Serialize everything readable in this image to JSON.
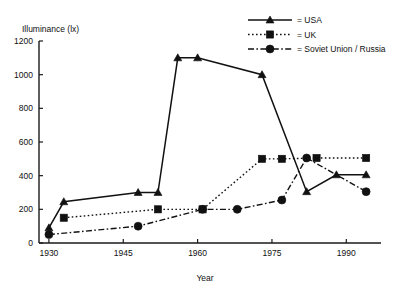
{
  "chart_data": {
    "type": "line",
    "title": "",
    "xlabel": "Year",
    "ylabel": "Illuminance (lx)",
    "xlim": [
      1928,
      1997
    ],
    "ylim": [
      0,
      1200
    ],
    "xticks": [
      1930,
      1945,
      1960,
      1975,
      1990
    ],
    "xticklabels": [
      "1930",
      "1945",
      "1960",
      "1975",
      "1990"
    ],
    "yticks": [
      0,
      200,
      400,
      600,
      800,
      1000,
      1200
    ],
    "yticklabels": [
      "0",
      "200",
      "400",
      "600",
      "800",
      "1000",
      "1200"
    ],
    "grid": false,
    "legend_position": "top-right",
    "series": [
      {
        "name": "USA",
        "legend_label": "= USA",
        "marker": "triangle",
        "linestyle": "solid",
        "color": "#111111",
        "points": [
          {
            "x": 1930,
            "y": 90
          },
          {
            "x": 1933,
            "y": 245
          },
          {
            "x": 1948,
            "y": 300
          },
          {
            "x": 1952,
            "y": 300
          },
          {
            "x": 1956,
            "y": 1100
          },
          {
            "x": 1960,
            "y": 1100
          },
          {
            "x": 1973,
            "y": 1000
          },
          {
            "x": 1982,
            "y": 305
          },
          {
            "x": 1988,
            "y": 405
          },
          {
            "x": 1994,
            "y": 405
          }
        ]
      },
      {
        "name": "UK",
        "legend_label": "= UK",
        "marker": "square",
        "linestyle": "dotted",
        "color": "#111111",
        "points": [
          {
            "x": 1933,
            "y": 150
          },
          {
            "x": 1952,
            "y": 200
          },
          {
            "x": 1961,
            "y": 200
          },
          {
            "x": 1973,
            "y": 500
          },
          {
            "x": 1977,
            "y": 500
          },
          {
            "x": 1984,
            "y": 505
          },
          {
            "x": 1994,
            "y": 505
          }
        ]
      },
      {
        "name": "Soviet Union / Russia",
        "legend_label": "= Soviet Union / Russia",
        "marker": "circle",
        "linestyle": "dashdot",
        "color": "#111111",
        "points": [
          {
            "x": 1930,
            "y": 50
          },
          {
            "x": 1948,
            "y": 100
          },
          {
            "x": 1961,
            "y": 200
          },
          {
            "x": 1968,
            "y": 200
          },
          {
            "x": 1977,
            "y": 255
          },
          {
            "x": 1982,
            "y": 505
          },
          {
            "x": 1994,
            "y": 305
          }
        ]
      }
    ]
  }
}
